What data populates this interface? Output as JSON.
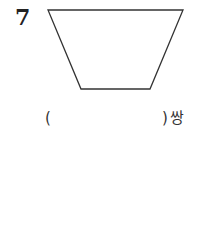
{
  "question": {
    "number": "7",
    "figure": "trapezoid",
    "answer_open": "(",
    "answer_close": ")",
    "answer_unit": "쌍"
  }
}
